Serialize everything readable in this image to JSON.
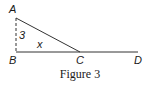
{
  "figure": {
    "caption": "Figure 3",
    "points": {
      "A": {
        "label": "A",
        "x": 16,
        "y": 18
      },
      "B": {
        "label": "B",
        "x": 16,
        "y": 52
      },
      "C": {
        "label": "C",
        "x": 80,
        "y": 52
      },
      "D": {
        "label": "D",
        "x": 138,
        "y": 52
      }
    },
    "side_labels": {
      "AB": "3",
      "angle_C": "x"
    },
    "colors": {
      "line": "#333333",
      "text": "#1a1a1a"
    }
  }
}
